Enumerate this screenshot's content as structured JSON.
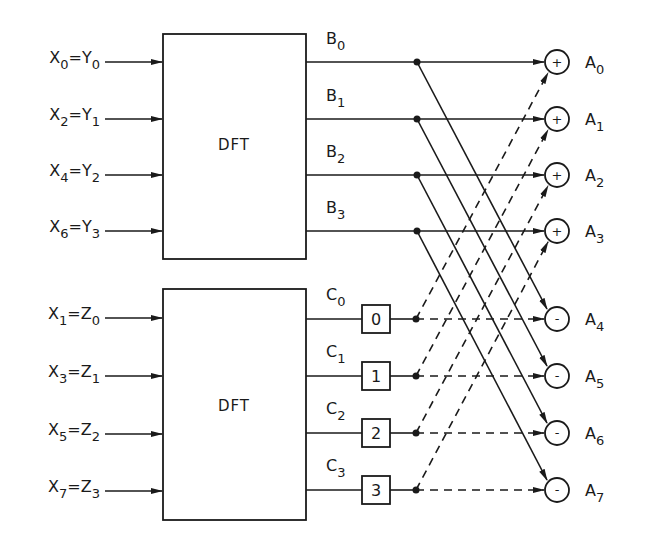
{
  "diagram": {
    "blocks": [
      {
        "id": "dft_even",
        "label": "DFT"
      },
      {
        "id": "dft_odd",
        "label": "DFT"
      }
    ],
    "even_inputs": [
      {
        "x": "X",
        "xi": "0",
        "y": "Y",
        "yi": "0"
      },
      {
        "x": "X",
        "xi": "2",
        "y": "Y",
        "yi": "1"
      },
      {
        "x": "X",
        "xi": "4",
        "y": "Y",
        "yi": "2"
      },
      {
        "x": "X",
        "xi": "6",
        "y": "Y",
        "yi": "3"
      }
    ],
    "odd_inputs": [
      {
        "x": "X",
        "xi": "1",
        "y": "Z",
        "yi": "0"
      },
      {
        "x": "X",
        "xi": "3",
        "y": "Z",
        "yi": "1"
      },
      {
        "x": "X",
        "xi": "5",
        "y": "Z",
        "yi": "2"
      },
      {
        "x": "X",
        "xi": "7",
        "y": "Z",
        "yi": "3"
      }
    ],
    "even_outputs": [
      {
        "name": "B",
        "idx": "0"
      },
      {
        "name": "B",
        "idx": "1"
      },
      {
        "name": "B",
        "idx": "2"
      },
      {
        "name": "B",
        "idx": "3"
      }
    ],
    "odd_outputs": [
      {
        "name": "C",
        "idx": "0"
      },
      {
        "name": "C",
        "idx": "1"
      },
      {
        "name": "C",
        "idx": "2"
      },
      {
        "name": "C",
        "idx": "3"
      }
    ],
    "twiddle_boxes": [
      "0",
      "1",
      "2",
      "3"
    ],
    "adders": [
      {
        "sign": "+",
        "name": "A",
        "idx": "0"
      },
      {
        "sign": "+",
        "name": "A",
        "idx": "1"
      },
      {
        "sign": "+",
        "name": "A",
        "idx": "2"
      },
      {
        "sign": "+",
        "name": "A",
        "idx": "3"
      },
      {
        "sign": "-",
        "name": "A",
        "idx": "4"
      },
      {
        "sign": "-",
        "name": "A",
        "idx": "5"
      },
      {
        "sign": "-",
        "name": "A",
        "idx": "6"
      },
      {
        "sign": "-",
        "name": "A",
        "idx": "7"
      }
    ],
    "equals": "="
  }
}
